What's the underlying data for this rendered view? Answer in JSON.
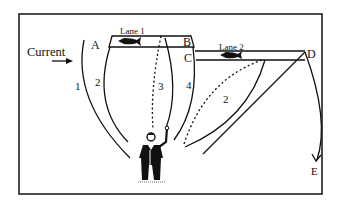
{
  "labels": {
    "current": "Current",
    "lane1": "Lane 1",
    "lane2": "Lane 2",
    "point_a": "A",
    "point_b": "B",
    "point_c": "C",
    "point_d": "D",
    "point_e": "E",
    "drift_1": "1",
    "drift_2": "2",
    "drift_3": "3",
    "drift_4": "4",
    "lane2_drift_2": "2"
  },
  "colors": {
    "ink": "#111111",
    "background": "#ffffff"
  }
}
